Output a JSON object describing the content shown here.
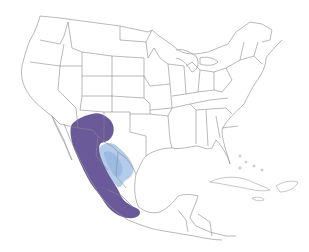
{
  "map": {
    "type": "species-range-map",
    "region": "North America (United States, Mexico, Central America, Caribbean)",
    "top_caption_cropped": "",
    "ranges": [
      {
        "name": "year-round",
        "color": "#6a5a9a",
        "area": "Southwestern US (SE Arizona / SW New Mexico / W Texas) south through the Mexican Sierra Madre highlands to central-southern Mexico"
      },
      {
        "name": "nonbreeding",
        "color": "#a9c3e6",
        "area": "Rio Grande valley of south Texas and northeastern Mexico"
      }
    ],
    "colors": {
      "background": "#ffffff",
      "borders": "#8a8a8a",
      "year_round": "#6a5a9a",
      "nonbreeding": "#a9c3e6",
      "nonbreeding_core": "#8fb0dc"
    }
  }
}
